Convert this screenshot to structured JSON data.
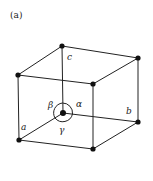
{
  "panel_label": "(a)",
  "labels": {
    "a": "a",
    "b": "b",
    "c": "c",
    "alpha": "α",
    "beta": "β",
    "gamma": "γ"
  },
  "colors": {
    "line": "#222222",
    "vertex": "#111111",
    "background": "#ffffff"
  }
}
